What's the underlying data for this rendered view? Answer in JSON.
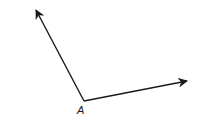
{
  "diagram": {
    "type": "angle",
    "vertex": {
      "label": "A",
      "x": 84,
      "y": 101
    },
    "rays": [
      {
        "name": "upper-left-ray",
        "to": {
          "x": 36,
          "y": 9
        }
      },
      {
        "name": "right-ray",
        "to": {
          "x": 188,
          "y": 81
        }
      }
    ],
    "stroke_color": "#1a1a1a",
    "background": "#ffffff"
  }
}
